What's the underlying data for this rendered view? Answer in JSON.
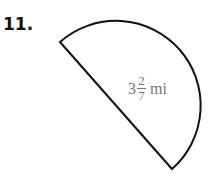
{
  "problem": {
    "number": "11.",
    "shape": "semicircle",
    "label": {
      "whole": "3",
      "numerator": "2",
      "denominator": "7",
      "unit": "mi"
    }
  }
}
